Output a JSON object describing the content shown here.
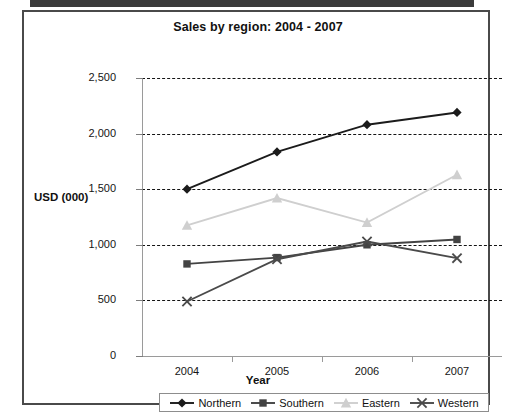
{
  "chart_data": {
    "type": "line",
    "title": "Sales by region: 2004 - 2007",
    "xlabel": "Year",
    "ylabel": "USD (000)",
    "categories": [
      "2004",
      "2005",
      "2006",
      "2007"
    ],
    "ylim": [
      0,
      2500
    ],
    "ytick_labels": [
      "0",
      "500",
      "1,000",
      "1,500",
      "2,000",
      "2,500"
    ],
    "ytick_values": [
      0,
      500,
      1000,
      1500,
      2000,
      2500
    ],
    "grid": "horizontal-dashed",
    "legend_position": "bottom",
    "series": [
      {
        "name": "Northern",
        "marker": "diamond",
        "color": "#1b1b1b",
        "values": [
          1500,
          1835,
          2080,
          2190
        ]
      },
      {
        "name": "Southern",
        "marker": "square",
        "color": "#434343",
        "values": [
          828,
          885,
          1000,
          1048
        ]
      },
      {
        "name": "Eastern",
        "marker": "triangle",
        "color": "#cfcfcf",
        "values": [
          1175,
          1420,
          1200,
          1630
        ]
      },
      {
        "name": "Western",
        "marker": "cross",
        "color": "#4a4a4a",
        "values": [
          490,
          870,
          1030,
          880
        ]
      }
    ]
  },
  "legend": {
    "items": [
      {
        "label": "Northern"
      },
      {
        "label": "Southern"
      },
      {
        "label": "Eastern"
      },
      {
        "label": "Western"
      }
    ]
  }
}
